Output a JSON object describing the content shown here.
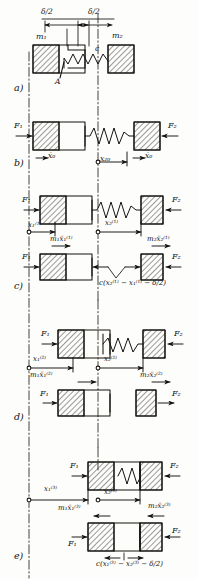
{
  "figure": {
    "kind": "engineering-free-body-diagram",
    "ink_color": "#14120f",
    "paper_color": "#fdfdfb"
  },
  "symbols": {
    "mass1": "m₁",
    "mass2": "m₂",
    "spring_const": "c",
    "point_A": "A",
    "gap_half": "δ/2",
    "force1": "F₁",
    "force2": "F₂"
  },
  "panels": [
    {
      "id": "a",
      "label": "a)",
      "caption_labels": {
        "m1": "m₁",
        "m2": "m₂",
        "spring": "c",
        "point": "A",
        "dim_left": "δ/2",
        "dim_right": "δ/2"
      }
    },
    {
      "id": "b",
      "label": "b)",
      "caption_labels": {
        "F1": "F₁",
        "F2": "F₂",
        "x0_left": "ẋ₀",
        "x20": "x₂₀",
        "x0_right": "ẋ₀"
      }
    },
    {
      "id": "c",
      "label": "c)",
      "caption_labels": {
        "F1_top": "F₁",
        "F2_top": "F₂",
        "x1": "x₁⁽¹⁾",
        "x2": "x₂⁽¹⁾",
        "inertia1": "m₁ẍ₁⁽¹⁾",
        "inertia2": "m₂ẍ₂⁽¹⁾",
        "F1_bottom": "F₁",
        "F2_bottom": "F₂",
        "spring_force": "c(x₂⁽¹⁾ − x₁⁽¹⁾ − δ/2)"
      }
    },
    {
      "id": "d",
      "label": "d)",
      "caption_labels": {
        "F1_top": "F₁",
        "F2_top": "F₂",
        "x1": "x₁⁽²⁾",
        "x2": "x₂⁽²⁾",
        "inertia1": "m₁ẍ₁⁽²⁾",
        "inertia2": "m₂ẍ₂⁽²⁾",
        "F1_bottom": "F₁",
        "F2_bottom": "F₂"
      }
    },
    {
      "id": "e",
      "label": "e)",
      "caption_labels": {
        "F1_top": "F₁",
        "F2_top": "F₂",
        "x1": "x₁⁽³⁾",
        "x2": "x₂⁽³⁾",
        "inertia1": "m₁ẍ₁⁽³⁾",
        "inertia2": "m₂ẍ₂⁽³⁾",
        "F1_bottom": "F₁",
        "F2_bottom": "F₂",
        "spring_force": "c(x₁⁽³⁾ − x₂⁽³⁾ − δ/2)"
      }
    }
  ]
}
